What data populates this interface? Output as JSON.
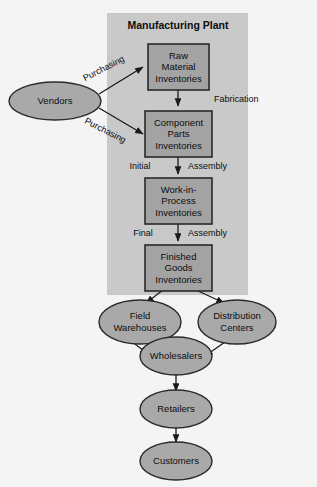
{
  "diagram": {
    "title": "Manufacturing Plant",
    "background_color": "#f4f4f4",
    "panel_color": "#c9c9c9",
    "box_color": "#a3a3a3",
    "ellipse_color": "#a9a9a9",
    "line_color": "#1a1a1a",
    "panel": {
      "label": "Manufacturing Plant"
    },
    "boxes": [
      {
        "id": "raw-material-inventories",
        "line1": "Raw",
        "line2": "Material",
        "line3": "Inventories"
      },
      {
        "id": "component-parts-inventories",
        "line1": "Component",
        "line2": "Parts",
        "line3": "Inventories"
      },
      {
        "id": "work-in-process-inventories",
        "line1": "Work-in-",
        "line2": "Process",
        "line3": "Inventories"
      },
      {
        "id": "finished-goods-inventories",
        "line1": "Finished",
        "line2": "Goods",
        "line3": "Inventories"
      }
    ],
    "ellipses": [
      {
        "id": "vendors",
        "line1": "Vendors",
        "line2": ""
      },
      {
        "id": "field-warehouses",
        "line1": "Field",
        "line2": "Warehouses"
      },
      {
        "id": "distribution-centers",
        "line1": "Distribution",
        "line2": "Centers"
      },
      {
        "id": "wholesalers",
        "line1": "Wholesalers",
        "line2": ""
      },
      {
        "id": "retailers",
        "line1": "Retailers",
        "line2": ""
      },
      {
        "id": "customers",
        "line1": "Customers",
        "line2": ""
      }
    ],
    "edge_labels": {
      "purchasing_top": "Purchasing",
      "purchasing_bottom": "Purchasing",
      "fabrication": "Fabrication",
      "initial": "Initial",
      "initial_assembly": "Assembly",
      "final": "Final",
      "final_assembly": "Assembly"
    }
  }
}
